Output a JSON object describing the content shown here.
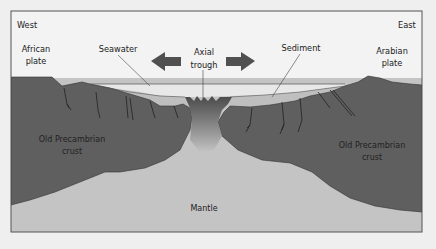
{
  "diagram": {
    "labels": {
      "west": "West",
      "east": "East",
      "african_plate_line1": "African",
      "african_plate_line2": "plate",
      "arabian_plate_line1": "Arabian",
      "arabian_plate_line2": "plate",
      "seawater": "Seawater",
      "axial_trough_line1": "Axial",
      "axial_trough_line2": "trough",
      "sediment": "Sediment",
      "crust_left_line1": "Old Precambrian",
      "crust_left_line2": "crust",
      "crust_right_line1": "Old Precambrian",
      "crust_right_line2": "crust",
      "mantle": "Mantle"
    },
    "arrows": [
      {
        "name": "spreading-arrow-west",
        "direction": "left"
      },
      {
        "name": "spreading-arrow-east",
        "direction": "right"
      }
    ],
    "colors": {
      "background": "#efefef",
      "sky": "#f2f2f2",
      "frame": "#555555",
      "crust": "#5e5e5e",
      "mantle": "#c3c3c3",
      "seawater": "#e6e6e6",
      "sediment": "#bdbdbd",
      "arrow": "#505050",
      "trough_dark": "#4a4a4a"
    }
  }
}
